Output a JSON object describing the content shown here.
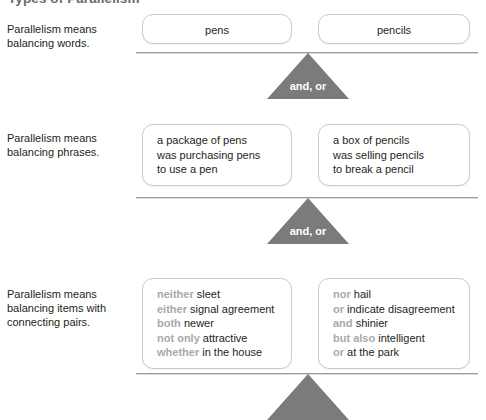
{
  "page": {
    "title": "Types of Parallelism"
  },
  "rows": [
    {
      "description": [
        "Parallelism means",
        "balancing words."
      ],
      "left_pan": {
        "lines": [
          {
            "cue": "",
            "text": "pens"
          }
        ]
      },
      "right_pan": {
        "lines": [
          {
            "cue": "",
            "text": "pencils"
          }
        ]
      },
      "fulcrum_label": "and, or"
    },
    {
      "description": [
        "Parallelism means",
        "balancing phrases."
      ],
      "left_pan": {
        "lines": [
          {
            "cue": "",
            "text": "a package of pens"
          },
          {
            "cue": "",
            "text": "was purchasing pens"
          },
          {
            "cue": "",
            "text": "to use a pen"
          }
        ]
      },
      "right_pan": {
        "lines": [
          {
            "cue": "",
            "text": "a box of pencils"
          },
          {
            "cue": "",
            "text": "was selling pencils"
          },
          {
            "cue": "",
            "text": "to break a pencil"
          }
        ]
      },
      "fulcrum_label": "and, or"
    },
    {
      "description": [
        "Parallelism means",
        "balancing items with",
        "connecting pairs."
      ],
      "left_pan": {
        "lines": [
          {
            "cue": "neither",
            "text": "sleet"
          },
          {
            "cue": "either",
            "text": "signal agreement"
          },
          {
            "cue": "both",
            "text": "newer"
          },
          {
            "cue": "not only",
            "text": "attractive"
          },
          {
            "cue": "whether",
            "text": "in the house"
          }
        ]
      },
      "right_pan": {
        "lines": [
          {
            "cue": "nor",
            "text": "hail"
          },
          {
            "cue": "or",
            "text": "indicate disagreement"
          },
          {
            "cue": "and",
            "text": "shinier"
          },
          {
            "cue": "but also",
            "text": "intelligent"
          },
          {
            "cue": "or",
            "text": "at the park"
          }
        ]
      },
      "fulcrum_label": ""
    }
  ],
  "colors": {
    "fulcrum": "#7b7b7b",
    "cue_text": "#a7a9ac",
    "body_text": "#231f20",
    "pan_border": "#c9cacc",
    "title": "#6e6a68"
  }
}
